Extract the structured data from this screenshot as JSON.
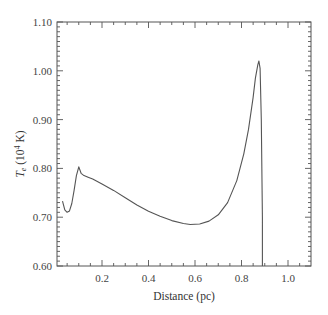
{
  "chart_data": {
    "type": "line",
    "title": "",
    "xlabel": "Distance (pc)",
    "ylabel": "T_e (10^4 K)",
    "ylabel_parts": {
      "main": "T",
      "sub": "e",
      "unit_pre": " (10",
      "sup": "4",
      "unit_post": " K)"
    },
    "xlim": [
      0.0,
      1.1
    ],
    "ylim": [
      0.6,
      1.1
    ],
    "xticks": [
      0.2,
      0.4,
      0.6,
      0.8,
      1.0
    ],
    "xtick_labels": [
      "0.2",
      "0.4",
      "0.6",
      "0.8",
      "1.0"
    ],
    "yticks": [
      0.6,
      0.7,
      0.8,
      0.9,
      1.0,
      1.1
    ],
    "ytick_labels": [
      "0.60",
      "0.70",
      "0.80",
      "0.90",
      "1.00",
      "1.10"
    ],
    "grid": false,
    "legend": null,
    "series": [
      {
        "name": "Te",
        "color": "#555555",
        "x": [
          0.03,
          0.04,
          0.05,
          0.06,
          0.07,
          0.08,
          0.09,
          0.1,
          0.11,
          0.12,
          0.14,
          0.16,
          0.2,
          0.25,
          0.3,
          0.35,
          0.4,
          0.45,
          0.5,
          0.55,
          0.58,
          0.62,
          0.66,
          0.7,
          0.74,
          0.78,
          0.81,
          0.83,
          0.85,
          0.86,
          0.87,
          0.875,
          0.88,
          0.885,
          0.89,
          0.89
        ],
        "y": [
          0.733,
          0.715,
          0.71,
          0.713,
          0.728,
          0.755,
          0.785,
          0.803,
          0.79,
          0.786,
          0.782,
          0.778,
          0.768,
          0.755,
          0.74,
          0.725,
          0.712,
          0.702,
          0.693,
          0.687,
          0.685,
          0.686,
          0.692,
          0.705,
          0.73,
          0.775,
          0.83,
          0.88,
          0.945,
          0.985,
          1.012,
          1.02,
          1.005,
          0.9,
          0.7,
          0.6
        ]
      }
    ]
  }
}
